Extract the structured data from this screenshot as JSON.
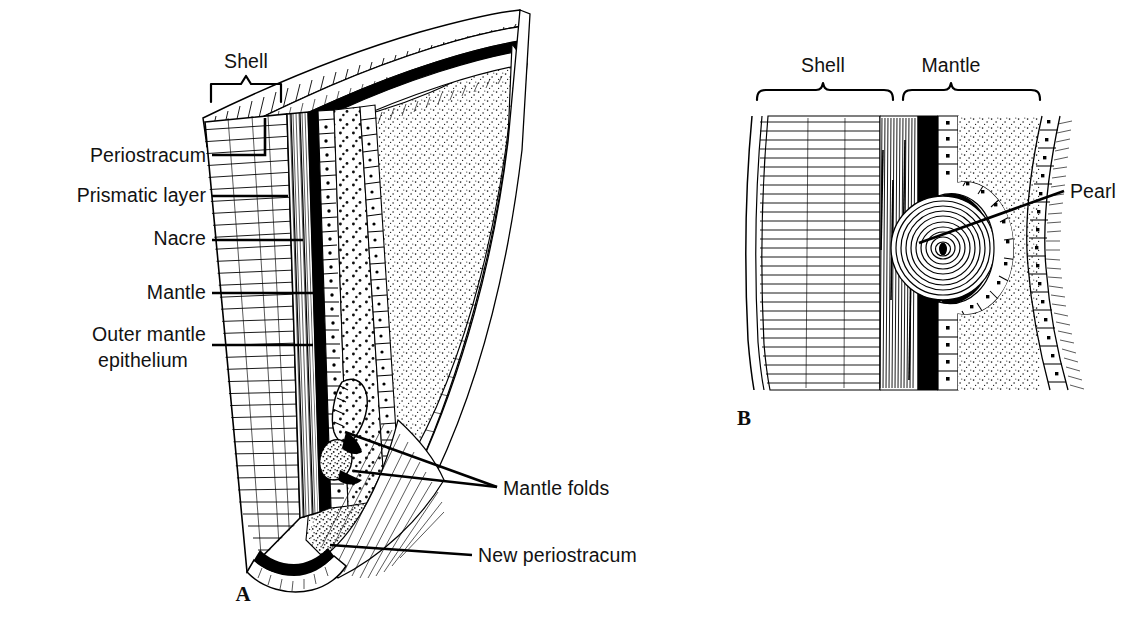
{
  "figure": {
    "background_color": "#ffffff",
    "ink_color": "#000000"
  },
  "panels": [
    {
      "id": "A",
      "letter": "A",
      "letter_pos": {
        "x": 243,
        "y": 601
      },
      "bracket": {
        "label": "Shell",
        "label_pos": {
          "x": 246,
          "y": 68
        },
        "style": "square-bracket",
        "x1": 211,
        "x2": 281,
        "y": 84,
        "depth": 18
      },
      "labels": [
        {
          "name": "periostracum",
          "text": "Periostracum",
          "lines": [
            "Periostracum"
          ],
          "anchor": "end",
          "x": 206,
          "y": 162,
          "leader": {
            "type": "elbow",
            "points": "212,155 265,155 265,118"
          }
        },
        {
          "name": "prismatic-layer",
          "text": "Prismatic layer",
          "lines": [
            "Prismatic layer"
          ],
          "anchor": "end",
          "x": 206,
          "y": 202,
          "leader": {
            "type": "straight",
            "points": "212,196 288,196"
          }
        },
        {
          "name": "nacre",
          "text": "Nacre",
          "lines": [
            "Nacre"
          ],
          "anchor": "end",
          "x": 206,
          "y": 245,
          "leader": {
            "type": "straight",
            "points": "212,240 303,240"
          }
        },
        {
          "name": "mantle",
          "text": "Mantle",
          "lines": [
            "Mantle"
          ],
          "anchor": "end",
          "x": 206,
          "y": 299,
          "leader": {
            "type": "straight",
            "points": "212,293 323,293"
          }
        },
        {
          "name": "outer-mantle-epithelium",
          "text": "Outer mantle epithelium",
          "lines": [
            "Outer mantle",
            "epithelium"
          ],
          "anchor": "end",
          "x": 206,
          "y": 341,
          "line_height": 26,
          "leader": {
            "type": "straight",
            "points": "212,345 313,345"
          }
        },
        {
          "name": "mantle-folds",
          "text": "Mantle folds",
          "lines": [
            "Mantle folds"
          ],
          "anchor": "start",
          "x": 503,
          "y": 495,
          "leader": {
            "type": "fork",
            "points": "497,487 345,432 497,487 354,471"
          }
        },
        {
          "name": "new-periostracum",
          "text": "New periostracum",
          "lines": [
            "New periostracum"
          ],
          "anchor": "start",
          "x": 478,
          "y": 562,
          "leader": {
            "type": "straight",
            "points": "472,555 330,545"
          }
        }
      ]
    },
    {
      "id": "B",
      "letter": "B",
      "letter_pos": {
        "x": 744,
        "y": 425
      },
      "brackets": [
        {
          "label": "Shell",
          "label_pos": {
            "x": 823,
            "y": 72
          },
          "style": "curly-brace",
          "x1": 757,
          "x2": 893,
          "y": 93
        },
        {
          "label": "Mantle",
          "label_pos": {
            "x": 951,
            "y": 72
          },
          "style": "curly-brace",
          "x1": 903,
          "x2": 1040,
          "y": 93
        }
      ],
      "labels": [
        {
          "name": "pearl",
          "text": "Pearl",
          "lines": [
            "Pearl"
          ],
          "anchor": "start",
          "x": 1070,
          "y": 198,
          "leader": {
            "type": "straight",
            "points": "1064,191 919,243"
          }
        }
      ]
    }
  ],
  "structures": {
    "panel_a": [
      {
        "name": "periostracum-band",
        "description": "thin dark outermost shell layer"
      },
      {
        "name": "prismatic-layer-band",
        "description": "horizontally hatched calcite prisms"
      },
      {
        "name": "nacre-band",
        "description": "finely striated mother-of-pearl layer"
      },
      {
        "name": "outer-mantle-epithelium-row",
        "description": "row of cuboidal cells with nuclei"
      },
      {
        "name": "mantle-tissue",
        "description": "stippled connective tissue"
      },
      {
        "name": "mantle-fold-inner",
        "description": "inner mantle fold projection"
      },
      {
        "name": "mantle-fold-middle",
        "description": "middle mantle fold projection"
      },
      {
        "name": "periostracal-groove",
        "description": "groove secreting new periostracum"
      }
    ],
    "panel_b": [
      {
        "name": "prismatic-layer-band",
        "description": "horizontal hatching"
      },
      {
        "name": "nacre-band",
        "description": "vertical striations"
      },
      {
        "name": "periostracum-band",
        "description": "solid black band"
      },
      {
        "name": "epithelium-cell-row",
        "description": "cuboidal cells arching around pearl"
      },
      {
        "name": "pearl-body",
        "description": "concentric nacreous laminae with dark nucleus"
      },
      {
        "name": "mantle-tissue",
        "description": "stippled tissue"
      },
      {
        "name": "ciliated-epithelium",
        "description": "outer cell row bearing cilia"
      }
    ]
  }
}
